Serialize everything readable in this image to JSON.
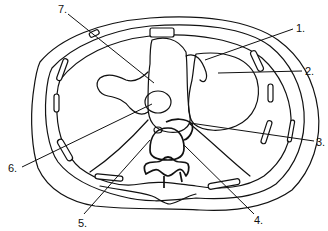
{
  "diagram": {
    "type": "anatomical cross-section line drawing",
    "colors": {
      "line": "#111111",
      "background": "#ffffff"
    },
    "labels": [
      {
        "id": "1",
        "text": "1.",
        "x": 296,
        "y": 32
      },
      {
        "id": "2",
        "text": "2.",
        "x": 305,
        "y": 75
      },
      {
        "id": "3",
        "text": "3.",
        "x": 317,
        "y": 145
      },
      {
        "id": "4",
        "text": "4.",
        "x": 256,
        "y": 222
      },
      {
        "id": "5",
        "text": "5.",
        "x": 78,
        "y": 226
      },
      {
        "id": "6",
        "text": "6.",
        "x": 8,
        "y": 172
      },
      {
        "id": "7",
        "text": "7.",
        "x": 60,
        "y": 12
      }
    ]
  }
}
